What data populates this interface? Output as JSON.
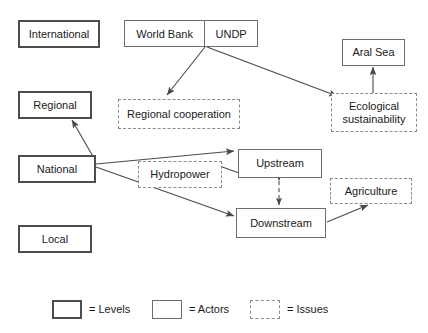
{
  "diagram": {
    "levels": [
      {
        "id": "international",
        "label": "International"
      },
      {
        "id": "regional",
        "label": "Regional"
      },
      {
        "id": "national",
        "label": "National"
      },
      {
        "id": "local",
        "label": "Local"
      }
    ],
    "actors": [
      {
        "id": "world_bank",
        "label": "World Bank"
      },
      {
        "id": "undp",
        "label": "UNDP"
      },
      {
        "id": "aral_sea",
        "label": "Aral Sea"
      },
      {
        "id": "upstream",
        "label": "Upstream"
      },
      {
        "id": "downstream",
        "label": "Downstream"
      }
    ],
    "issues": [
      {
        "id": "regional_cooperation",
        "label": "Regional cooperation"
      },
      {
        "id": "ecological_sustainability",
        "label": "Ecological sustainability"
      },
      {
        "id": "hydropower",
        "label": "Hydropower"
      },
      {
        "id": "agriculture",
        "label": "Agriculture"
      }
    ],
    "edges": [
      {
        "from": "world_bank_undp",
        "to": "regional_cooperation",
        "style": "solid",
        "heads": "one"
      },
      {
        "from": "world_bank_undp",
        "to": "ecological_sustainability",
        "style": "solid",
        "heads": "one"
      },
      {
        "from": "ecological_sustainability",
        "to": "aral_sea",
        "style": "solid",
        "heads": "one"
      },
      {
        "from": "national",
        "to": "regional",
        "style": "solid",
        "heads": "one"
      },
      {
        "from": "national",
        "to": "upstream",
        "style": "solid",
        "heads": "one"
      },
      {
        "from": "upstream",
        "to": "hydropower",
        "style": "solid",
        "heads": "one"
      },
      {
        "from": "national",
        "to": "downstream",
        "style": "solid",
        "heads": "one"
      },
      {
        "from": "upstream",
        "to": "downstream",
        "style": "dashed",
        "heads": "both"
      },
      {
        "from": "downstream",
        "to": "agriculture",
        "style": "solid",
        "heads": "one"
      }
    ]
  },
  "legend": {
    "items": [
      {
        "id": "levels",
        "shape": "level",
        "label": "= Levels"
      },
      {
        "id": "actors",
        "shape": "actor",
        "label": "= Actors"
      },
      {
        "id": "issues",
        "shape": "issue",
        "label": "= Issues"
      }
    ]
  },
  "colors": {
    "level_border": "#4d4d4d",
    "actor_border": "#6e6e6e",
    "issue_border": "#8a8a8a",
    "line": "#4a4a4a",
    "text": "#1a1a1a",
    "background": "#ffffff"
  }
}
